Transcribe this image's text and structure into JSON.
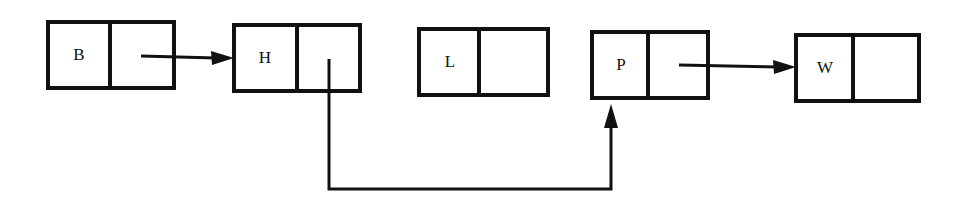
{
  "diagram": {
    "type": "linked-list",
    "nodes": [
      {
        "id": "B",
        "label": "B",
        "x": 48,
        "y": 22,
        "w": 126,
        "h": 66,
        "div": 110
      },
      {
        "id": "H",
        "label": "H",
        "x": 234,
        "y": 25,
        "w": 126,
        "h": 66,
        "div": 297
      },
      {
        "id": "L",
        "label": "L",
        "x": 419,
        "y": 29,
        "w": 129,
        "h": 66,
        "div": 479
      },
      {
        "id": "P",
        "label": "P",
        "x": 592,
        "y": 32,
        "w": 116,
        "h": 66,
        "div": 648
      },
      {
        "id": "W",
        "label": "W",
        "x": 796,
        "y": 35,
        "w": 123,
        "h": 66,
        "div": 853
      }
    ],
    "edges": [
      {
        "from": "B",
        "to": "H"
      },
      {
        "from": "H",
        "to": "P"
      },
      {
        "from": "P",
        "to": "W"
      }
    ],
    "colors": {
      "stroke": "#111111",
      "background": "#ffffff"
    }
  }
}
